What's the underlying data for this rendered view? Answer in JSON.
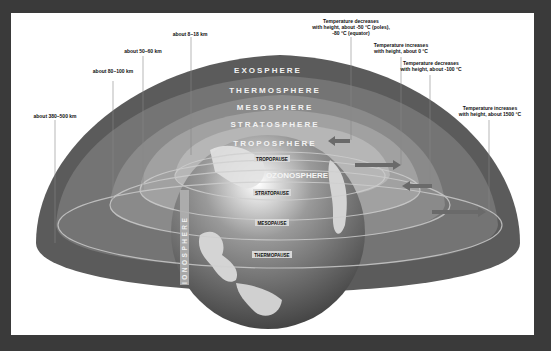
{
  "diagram": {
    "layers": [
      {
        "name": "EXOSPHERE",
        "altitude": "about 380–500 km",
        "temperature": "Temperature increases with height, about 1500 °C",
        "color": "#5a5a5a"
      },
      {
        "name": "THERMOSPHERE",
        "altitude": "about 80–100 km",
        "temperature": "Temperature decreases with height, about -100 °C",
        "color": "#727272"
      },
      {
        "name": "MESOSPHERE",
        "altitude": "about 50–60 km",
        "temperature": "Temperature increases with height, about 0 °C",
        "color": "#8a8a8a"
      },
      {
        "name": "STRATOSPHERE",
        "altitude": "",
        "temperature": "",
        "color": "#a0a0a0"
      },
      {
        "name": "TROPOSPHERE",
        "altitude": "about 8–18 km",
        "temperature": "Temperature decreases with height, about -50 °C (poles), -80 °C (equator)",
        "color": "#b8b8b8"
      }
    ],
    "altitude_labels": [
      "about 8–18 km",
      "about 50–60 km",
      "about 80–100 km",
      "about 380–500 km"
    ],
    "temperature_labels": {
      "troposphere": [
        "Temperature decreases",
        "with height, about -50 °C (poles),",
        "-80 °C (equator)"
      ],
      "stratosphere": [
        "Temperature increases",
        "with height, about 0 °C"
      ],
      "mesosphere": [
        "Temperature decreases",
        "with height, about -100 °C"
      ],
      "thermosphere": [
        "Temperature increases",
        "with height, about 1500 °C"
      ]
    },
    "boundaries": [
      "TROPOPAUSE",
      "STRATOPAUSE",
      "MESOPAUSE",
      "THERMOPAUSE"
    ],
    "special_regions": {
      "ozone": "OZONOSPHERE",
      "ionosphere": "IONOSPHERE"
    },
    "colors": {
      "frame": "#3a3a3a",
      "background": "#ffffff",
      "ocean": "#4a4a4a",
      "land": "#d8d8d8"
    }
  }
}
